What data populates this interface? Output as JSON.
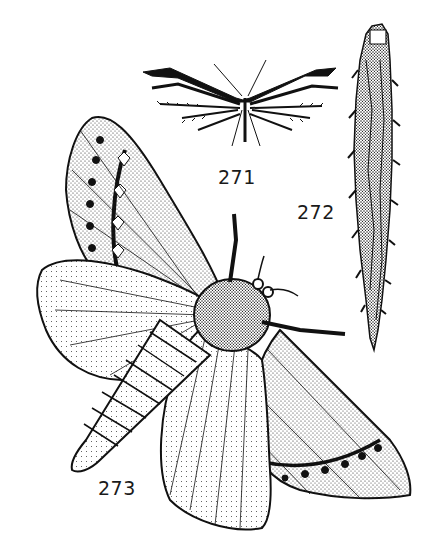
{
  "plate": {
    "background": "#ffffff",
    "ink": "#1a1a1a",
    "figures": [
      {
        "number": "271",
        "subject": "plume moth (spread wings, feathered lobes)"
      },
      {
        "number": "272",
        "subject": "spiny larva / caterpillar case"
      },
      {
        "number": "273",
        "subject": "moth with spread wings, stippled, eyespot rows"
      }
    ]
  }
}
